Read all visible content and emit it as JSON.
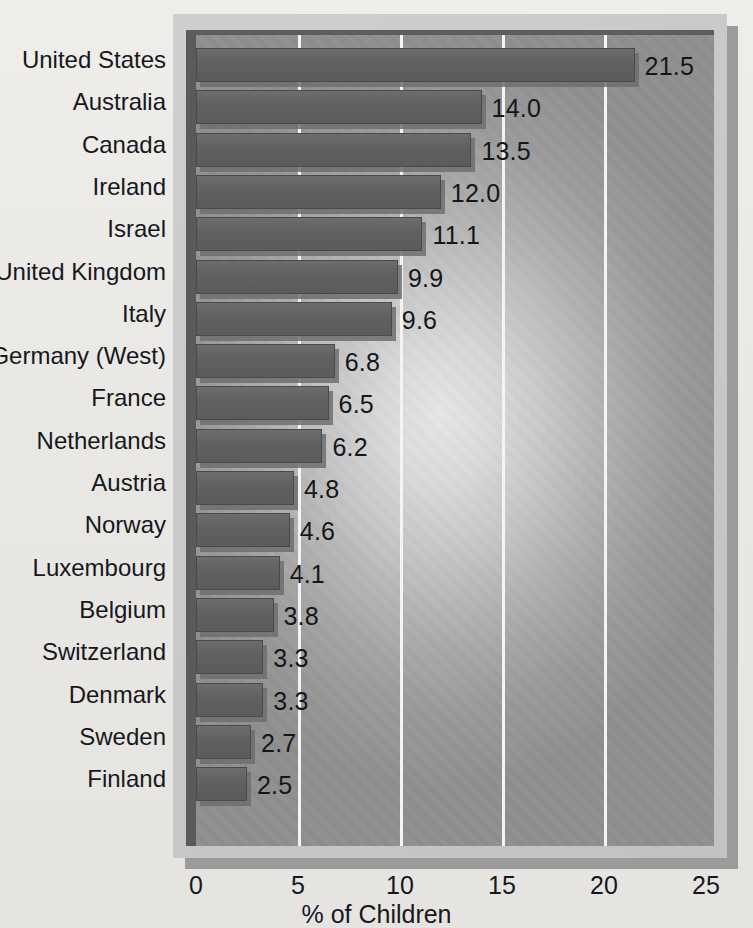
{
  "chart_data": {
    "type": "bar",
    "orientation": "horizontal",
    "title": "",
    "xlabel": "% of Children",
    "ylabel": "",
    "xlim": [
      0,
      25
    ],
    "xticks": [
      0,
      5,
      10,
      15,
      20,
      25
    ],
    "xtick_labels": [
      "0",
      "5",
      "10",
      "15",
      "20",
      "25"
    ],
    "grid": true,
    "grid_axis": "x",
    "legend": null,
    "categories": [
      "United States",
      "Australia",
      "Canada",
      "Ireland",
      "Israel",
      "United Kingdom",
      "Italy",
      "Germany (West)",
      "France",
      "Netherlands",
      "Austria",
      "Norway",
      "Luxembourg",
      "Belgium",
      "Switzerland",
      "Denmark",
      "Sweden",
      "Finland"
    ],
    "values": [
      21.5,
      14.0,
      13.5,
      12.0,
      11.1,
      9.9,
      9.6,
      6.8,
      6.5,
      6.2,
      4.8,
      4.6,
      4.1,
      3.8,
      3.3,
      3.3,
      2.7,
      2.5
    ],
    "value_labels": [
      "21.5",
      "14.0",
      "13.5",
      "12.0",
      "11.1",
      "9.9",
      "9.6",
      "6.8",
      "6.5",
      "6.2",
      "4.8",
      "4.6",
      "4.1",
      "3.8",
      "3.3",
      "3.3",
      "2.7",
      "2.5"
    ],
    "colors": {
      "bar": "#616161",
      "bar_border": "#4a4a4a",
      "bar_shadow": "#6f6f6f",
      "plot_background_center": "#e9e9e9",
      "plot_background_edge": "#8f8f8f",
      "frame": "#c8c8c8",
      "frame_shadow": "#9b9b9b",
      "gridline": "#f4f4f4",
      "text": "#17181c",
      "page_background": "#eceae7"
    }
  }
}
